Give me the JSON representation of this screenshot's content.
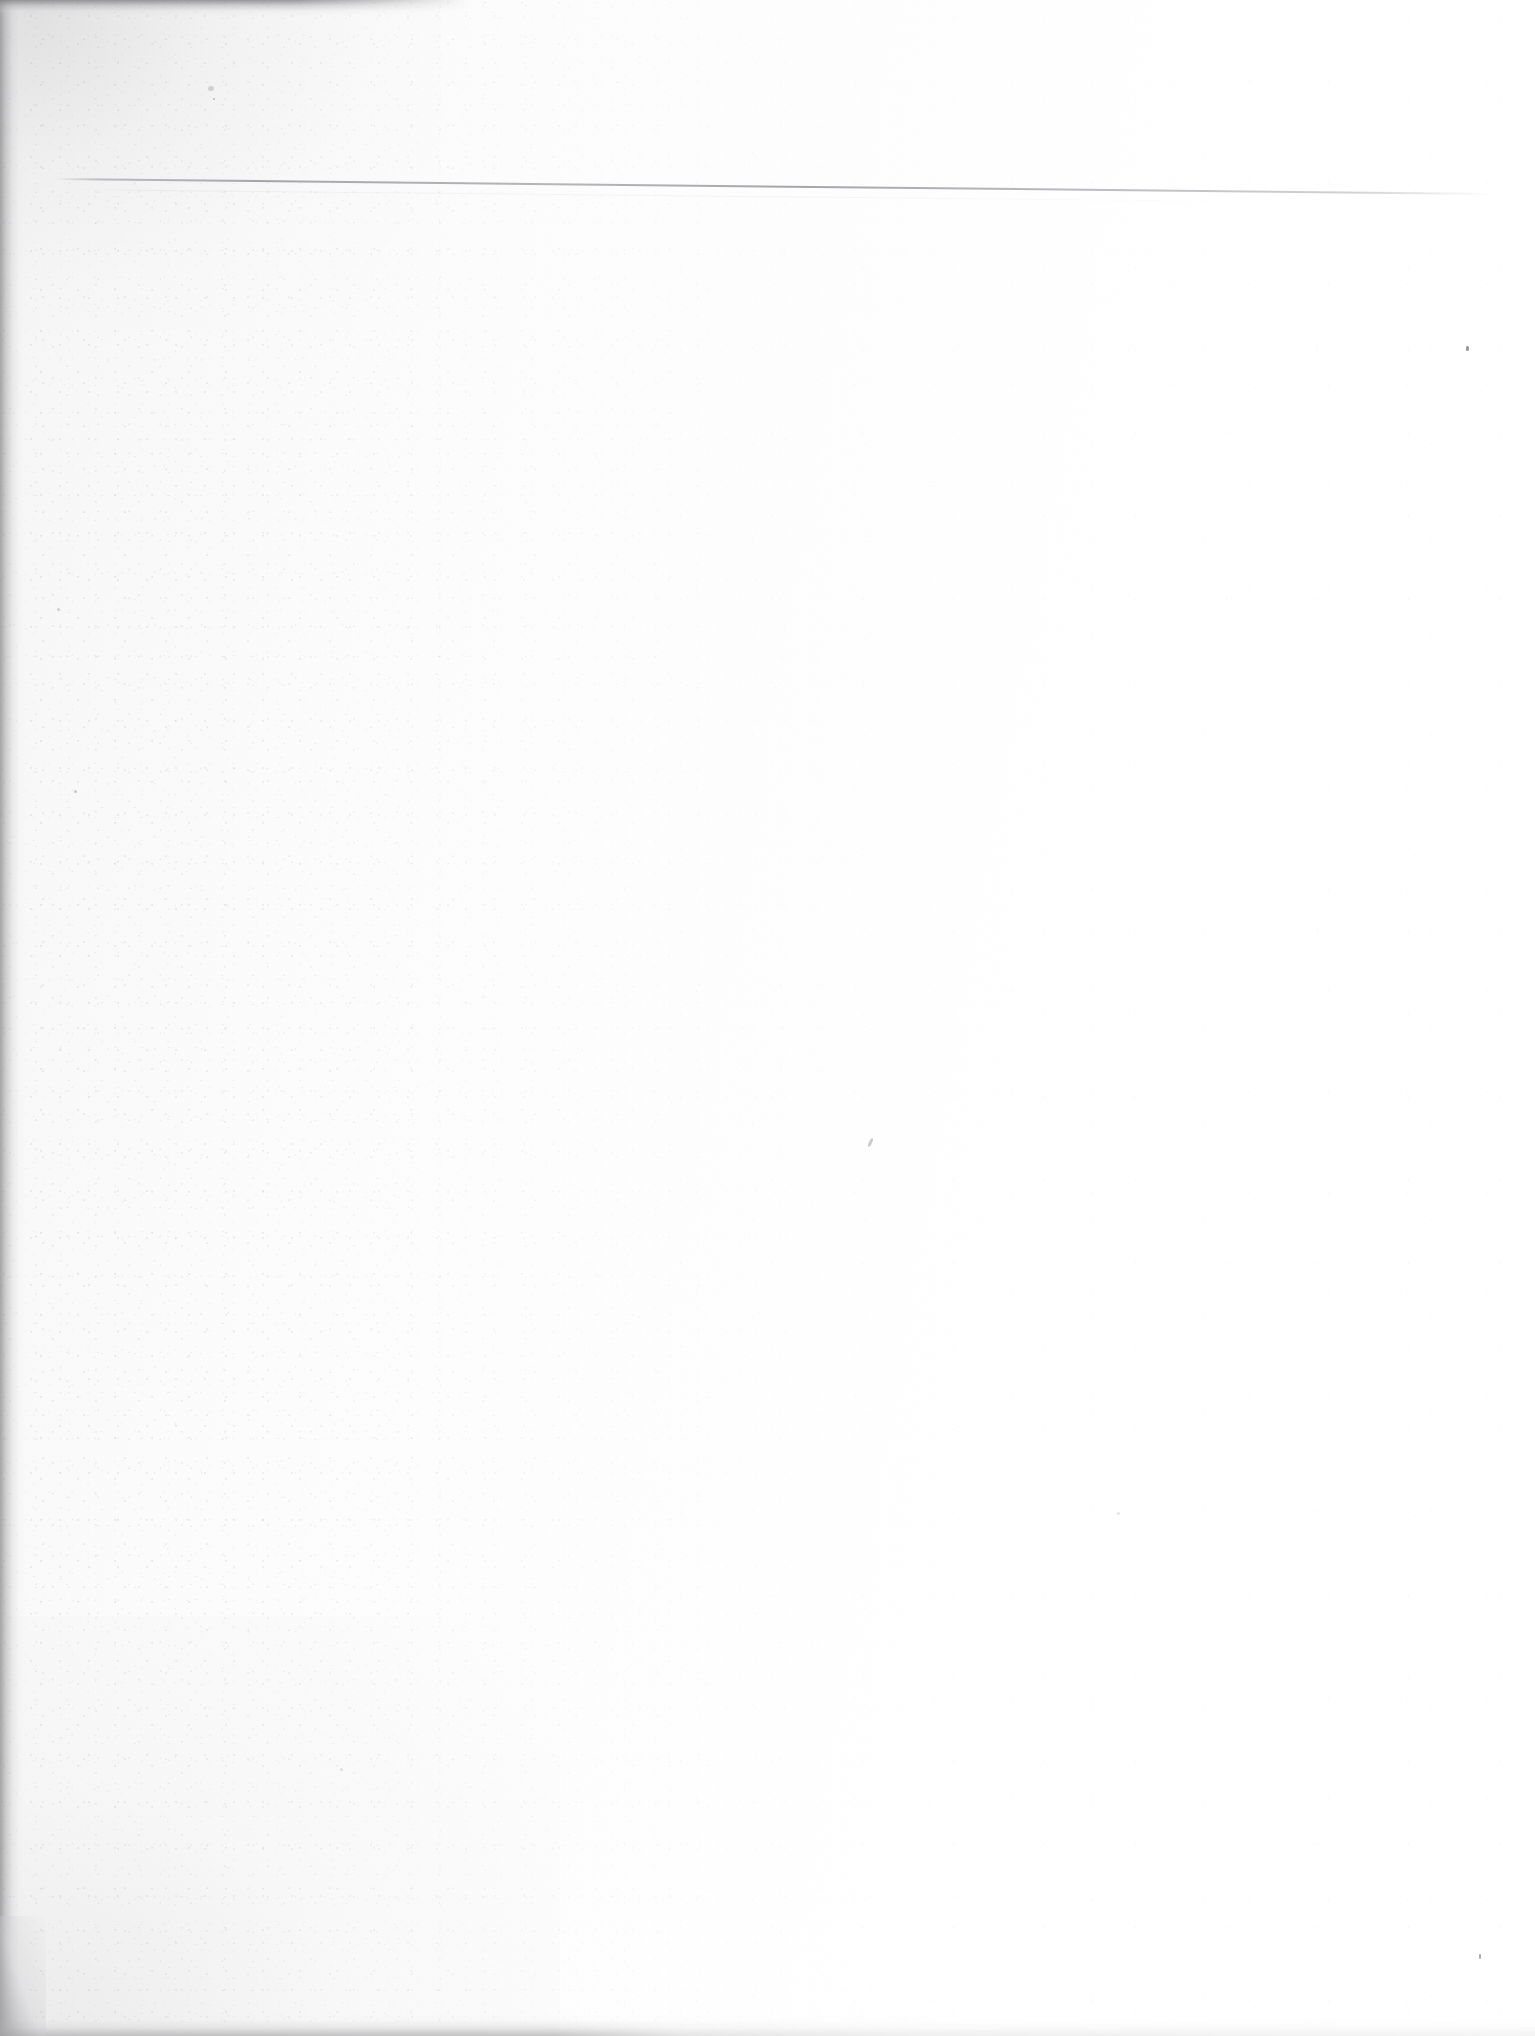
{
  "document": {
    "kind": "scanned-page",
    "content_text": "",
    "page_note": ""
  },
  "page": {
    "width": 1535,
    "height": 2036,
    "background_color": "#fefefe",
    "paper_tone_left": "#f4f4f4",
    "paper_tone_right": "#ffffff"
  },
  "artifacts": {
    "rule_line": {
      "label": "",
      "color": "#60606c",
      "start_x": 55,
      "start_y": 178,
      "end_x": 1495,
      "end_y": 193
    },
    "edges": {
      "left_shadow_color": "#969698",
      "top_shadow_color": "#808084",
      "bottom_shadow_color": "#b0b0b2"
    },
    "specks": [
      {
        "x": 1466,
        "y": 346,
        "color": "#5a5a62"
      },
      {
        "x": 869,
        "y": 1138,
        "color": "#5a5a62"
      },
      {
        "x": 1479,
        "y": 1954,
        "color": "#5a5a62"
      }
    ]
  }
}
